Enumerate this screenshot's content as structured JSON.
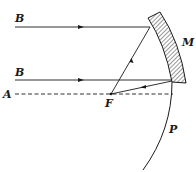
{
  "diagram": {
    "type": "optics-ray-diagram",
    "labels": {
      "ray_top": "B",
      "ray_bottom": "B",
      "axis": "A",
      "focus": "F",
      "mirror": "M",
      "surface": "P"
    },
    "colors": {
      "line": "#1a1a1a",
      "background": "#ffffff"
    }
  }
}
